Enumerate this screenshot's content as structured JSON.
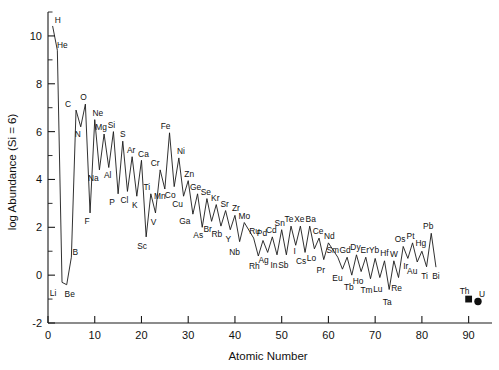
{
  "chart_data": {
    "type": "line",
    "title": "",
    "xlabel": "Atomic Number",
    "ylabel": "log Abundance (Si = 6)",
    "xlim": [
      0,
      95
    ],
    "ylim": [
      -2,
      11
    ],
    "xticks": [
      0,
      10,
      20,
      30,
      40,
      50,
      60,
      70,
      80,
      90
    ],
    "xtick_labels": [
      "0",
      "10",
      "20",
      "30",
      "40",
      "50",
      "60",
      "70",
      "80",
      "90"
    ],
    "yticks": [
      -2,
      0,
      2,
      4,
      6,
      8,
      10
    ],
    "ytick_labels": [
      "-2",
      "0",
      "2",
      "4",
      "6",
      "8",
      "10"
    ],
    "yminor_ticks": [
      -1,
      1,
      3,
      5,
      7,
      9,
      11
    ],
    "grid": false,
    "legend": "none",
    "x": [
      1,
      2,
      3,
      4,
      5,
      6,
      7,
      8,
      9,
      10,
      11,
      12,
      13,
      14,
      15,
      16,
      17,
      18,
      19,
      20,
      21,
      22,
      23,
      24,
      25,
      26,
      27,
      28,
      29,
      30,
      31,
      32,
      33,
      34,
      35,
      36,
      37,
      38,
      39,
      40,
      41,
      42,
      44,
      45,
      46,
      47,
      48,
      49,
      50,
      51,
      52,
      53,
      54,
      55,
      56,
      57,
      58,
      59,
      60,
      62,
      63,
      64,
      65,
      66,
      67,
      68,
      69,
      70,
      71,
      72,
      73,
      74,
      75,
      76,
      77,
      78,
      79,
      80,
      81,
      82,
      83
    ],
    "values": [
      10.4,
      9.4,
      -0.3,
      -0.4,
      0.75,
      6.9,
      6.2,
      7.15,
      2.6,
      6.5,
      4.4,
      5.9,
      4.5,
      6.0,
      3.4,
      5.6,
      3.5,
      4.95,
      3.3,
      4.8,
      1.6,
      3.4,
      2.6,
      4.4,
      3.6,
      5.95,
      3.7,
      4.9,
      3.3,
      3.95,
      2.55,
      3.4,
      2.0,
      3.2,
      2.25,
      2.95,
      2.05,
      2.7,
      1.9,
      2.5,
      1.4,
      2.2,
      1.55,
      0.8,
      1.45,
      0.95,
      1.6,
      0.85,
      1.9,
      0.85,
      2.05,
      1.25,
      2.05,
      0.95,
      2.05,
      1.1,
      1.55,
      0.65,
      1.35,
      0.75,
      0.25,
      0.75,
      0.0,
      0.85,
      0.15,
      0.75,
      -0.15,
      0.7,
      -0.1,
      0.6,
      -0.6,
      0.6,
      -0.1,
      1.2,
      0.7,
      1.35,
      0.55,
      1.0,
      0.35,
      1.75,
      0.35
    ],
    "labels": [
      {
        "el": "H",
        "z": 1,
        "v": 10.4,
        "dx": 5,
        "dy": -3
      },
      {
        "el": "He",
        "z": 2,
        "v": 9.4,
        "dx": 5,
        "dy": -2
      },
      {
        "el": "Li",
        "z": 3,
        "v": -0.3,
        "dx": -9,
        "dy": 14
      },
      {
        "el": "Be",
        "z": 4,
        "v": -0.4,
        "dx": 3,
        "dy": 12
      },
      {
        "el": "B",
        "z": 5,
        "v": 0.75,
        "dx": 4,
        "dy": -2
      },
      {
        "el": "C",
        "z": 6,
        "v": 6.9,
        "dx": -8,
        "dy": -3
      },
      {
        "el": "N",
        "z": 7,
        "v": 6.2,
        "dx": -3,
        "dy": 10
      },
      {
        "el": "O",
        "z": 8,
        "v": 7.15,
        "dx": -2,
        "dy": -4
      },
      {
        "el": "F",
        "z": 9,
        "v": 2.6,
        "dx": -3,
        "dy": 11
      },
      {
        "el": "Ne",
        "z": 10,
        "v": 6.5,
        "dx": 3,
        "dy": -4
      },
      {
        "el": "Na",
        "z": 11,
        "v": 4.4,
        "dx": -6,
        "dy": 11
      },
      {
        "el": "Mg",
        "z": 12,
        "v": 5.9,
        "dx": -3,
        "dy": -4
      },
      {
        "el": "Al",
        "z": 13,
        "v": 4.5,
        "dx": -1,
        "dy": 10
      },
      {
        "el": "Si",
        "z": 14,
        "v": 6.0,
        "dx": -2,
        "dy": -4
      },
      {
        "el": "P",
        "z": 15,
        "v": 3.4,
        "dx": -6,
        "dy": 11
      },
      {
        "el": "S",
        "z": 16,
        "v": 5.6,
        "dx": 0,
        "dy": -4
      },
      {
        "el": "Cl",
        "z": 17,
        "v": 3.5,
        "dx": -3,
        "dy": 12
      },
      {
        "el": "Ar",
        "z": 18,
        "v": 4.95,
        "dx": -1,
        "dy": -4
      },
      {
        "el": "K",
        "z": 19,
        "v": 3.3,
        "dx": -2,
        "dy": 12
      },
      {
        "el": "Ca",
        "z": 20,
        "v": 4.8,
        "dx": 2,
        "dy": -3
      },
      {
        "el": "Sc",
        "z": 21,
        "v": 1.6,
        "dx": -4,
        "dy": 12
      },
      {
        "el": "Ti",
        "z": 22,
        "v": 3.4,
        "dx": -4,
        "dy": -4
      },
      {
        "el": "V",
        "z": 23,
        "v": 2.6,
        "dx": -2,
        "dy": 12
      },
      {
        "el": "Cr",
        "z": 24,
        "v": 4.4,
        "dx": -5,
        "dy": -4
      },
      {
        "el": "Mn",
        "z": 25,
        "v": 3.6,
        "dx": -5,
        "dy": 10
      },
      {
        "el": "Fe",
        "z": 26,
        "v": 5.95,
        "dx": -4,
        "dy": -4
      },
      {
        "el": "Co",
        "z": 27,
        "v": 3.7,
        "dx": -4,
        "dy": 11
      },
      {
        "el": "Ni",
        "z": 28,
        "v": 4.9,
        "dx": 2,
        "dy": -4
      },
      {
        "el": "Cu",
        "z": 29,
        "v": 3.3,
        "dx": -6,
        "dy": 11
      },
      {
        "el": "Zn",
        "z": 30,
        "v": 3.95,
        "dx": 1,
        "dy": -4
      },
      {
        "el": "Ga",
        "z": 31,
        "v": 2.55,
        "dx": -8,
        "dy": 10
      },
      {
        "el": "Ge",
        "z": 32,
        "v": 3.4,
        "dx": -2,
        "dy": -4
      },
      {
        "el": "As",
        "z": 33,
        "v": 2.0,
        "dx": -4,
        "dy": 11
      },
      {
        "el": "Se",
        "z": 34,
        "v": 3.2,
        "dx": -1,
        "dy": -4
      },
      {
        "el": "Br",
        "z": 35,
        "v": 2.25,
        "dx": -4,
        "dy": 11
      },
      {
        "el": "Kr",
        "z": 36,
        "v": 2.95,
        "dx": -1,
        "dy": -4
      },
      {
        "el": "Rb",
        "z": 37,
        "v": 2.05,
        "dx": -4,
        "dy": 11
      },
      {
        "el": "Sr",
        "z": 38,
        "v": 2.7,
        "dx": -1,
        "dy": -4
      },
      {
        "el": "Y",
        "z": 39,
        "v": 1.9,
        "dx": -2,
        "dy": 12
      },
      {
        "el": "Zr",
        "z": 40,
        "v": 2.5,
        "dx": 1,
        "dy": -4
      },
      {
        "el": "Nb",
        "z": 41,
        "v": 1.4,
        "dx": -5,
        "dy": 13
      },
      {
        "el": "Mo",
        "z": 42,
        "v": 2.2,
        "dx": 0,
        "dy": -4
      },
      {
        "el": "Ru",
        "z": 44,
        "v": 1.55,
        "dx": 1,
        "dy": -4
      },
      {
        "el": "Rh",
        "z": 45,
        "v": 0.8,
        "dx": -4,
        "dy": 13
      },
      {
        "el": "Pd",
        "z": 46,
        "v": 1.45,
        "dx": -1,
        "dy": -4
      },
      {
        "el": "Ag",
        "z": 47,
        "v": 0.95,
        "dx": -4,
        "dy": 11
      },
      {
        "el": "Cd",
        "z": 48,
        "v": 1.6,
        "dx": -1,
        "dy": -4
      },
      {
        "el": "In",
        "z": 49,
        "v": 0.85,
        "dx": -3,
        "dy": 13
      },
      {
        "el": "Sn",
        "z": 50,
        "v": 1.9,
        "dx": -2,
        "dy": -4
      },
      {
        "el": "Sb",
        "z": 51,
        "v": 0.85,
        "dx": -3,
        "dy": 13
      },
      {
        "el": "Te",
        "z": 52,
        "v": 2.05,
        "dx": -2,
        "dy": -4
      },
      {
        "el": "I",
        "z": 53,
        "v": 1.25,
        "dx": -1,
        "dy": 9
      },
      {
        "el": "Xe",
        "z": 54,
        "v": 2.05,
        "dx": -1,
        "dy": -4
      },
      {
        "el": "Cs",
        "z": 55,
        "v": 0.95,
        "dx": -4,
        "dy": 12
      },
      {
        "el": "Ba",
        "z": 56,
        "v": 2.05,
        "dx": 1,
        "dy": -4
      },
      {
        "el": "Lo",
        "z": 57,
        "v": 1.1,
        "dx": -3,
        "dy": 12
      },
      {
        "el": "Ce",
        "z": 58,
        "v": 1.55,
        "dx": -1,
        "dy": -4
      },
      {
        "el": "Pr",
        "z": 59,
        "v": 0.65,
        "dx": -3,
        "dy": 13
      },
      {
        "el": "Nd",
        "z": 60,
        "v": 1.35,
        "dx": 1,
        "dy": -4
      },
      {
        "el": "Sm",
        "z": 62,
        "v": 0.75,
        "dx": -5,
        "dy": -4
      },
      {
        "el": "Eu",
        "z": 63,
        "v": 0.25,
        "dx": -5,
        "dy": 12
      },
      {
        "el": "Gd",
        "z": 64,
        "v": 0.75,
        "dx": -2,
        "dy": -4
      },
      {
        "el": "Tb",
        "z": 65,
        "v": 0.0,
        "dx": -3,
        "dy": 15
      },
      {
        "el": "Dy",
        "z": 66,
        "v": 0.85,
        "dx": -1,
        "dy": -5
      },
      {
        "el": "Ho",
        "z": 67,
        "v": 0.15,
        "dx": -3,
        "dy": 12
      },
      {
        "el": "Er",
        "z": 68,
        "v": 0.75,
        "dx": -1,
        "dy": -4
      },
      {
        "el": "Tm",
        "z": 69,
        "v": -0.15,
        "dx": -4,
        "dy": 14
      },
      {
        "el": "Yb",
        "z": 70,
        "v": 0.7,
        "dx": -1,
        "dy": -5
      },
      {
        "el": "Lu",
        "z": 71,
        "v": -0.1,
        "dx": -2,
        "dy": 14
      },
      {
        "el": "Hf",
        "z": 72,
        "v": 0.6,
        "dx": 0,
        "dy": -5
      },
      {
        "el": "Ta",
        "z": 73,
        "v": -0.6,
        "dx": -2,
        "dy": 15
      },
      {
        "el": "W",
        "z": 74,
        "v": 0.6,
        "dx": 0,
        "dy": -4
      },
      {
        "el": "Re",
        "z": 75,
        "v": -0.1,
        "dx": -2,
        "dy": 13
      },
      {
        "el": "Os",
        "z": 76,
        "v": 1.2,
        "dx": -3,
        "dy": -4
      },
      {
        "el": "Ir",
        "z": 77,
        "v": 0.7,
        "dx": -2,
        "dy": 11
      },
      {
        "el": "Pt",
        "z": 78,
        "v": 1.35,
        "dx": -2,
        "dy": -4
      },
      {
        "el": "Au",
        "z": 79,
        "v": 0.55,
        "dx": -5,
        "dy": 12
      },
      {
        "el": "Hg",
        "z": 80,
        "v": 1.0,
        "dx": -1,
        "dy": -5
      },
      {
        "el": "Ti",
        "z": 81,
        "v": 0.35,
        "dx": -2,
        "dy": 12
      },
      {
        "el": "Pb",
        "z": 82,
        "v": 1.75,
        "dx": -3,
        "dy": -4
      },
      {
        "el": "Bi",
        "z": 83,
        "v": 0.35,
        "dx": 0,
        "dy": 12
      }
    ],
    "markers": [
      {
        "el": "Th",
        "z": 90,
        "v": -1.0,
        "shape": "square",
        "dx": -4,
        "dy": -5
      },
      {
        "el": "U",
        "z": 92,
        "v": -1.1,
        "shape": "circle",
        "dx": 4,
        "dy": -4
      }
    ]
  }
}
